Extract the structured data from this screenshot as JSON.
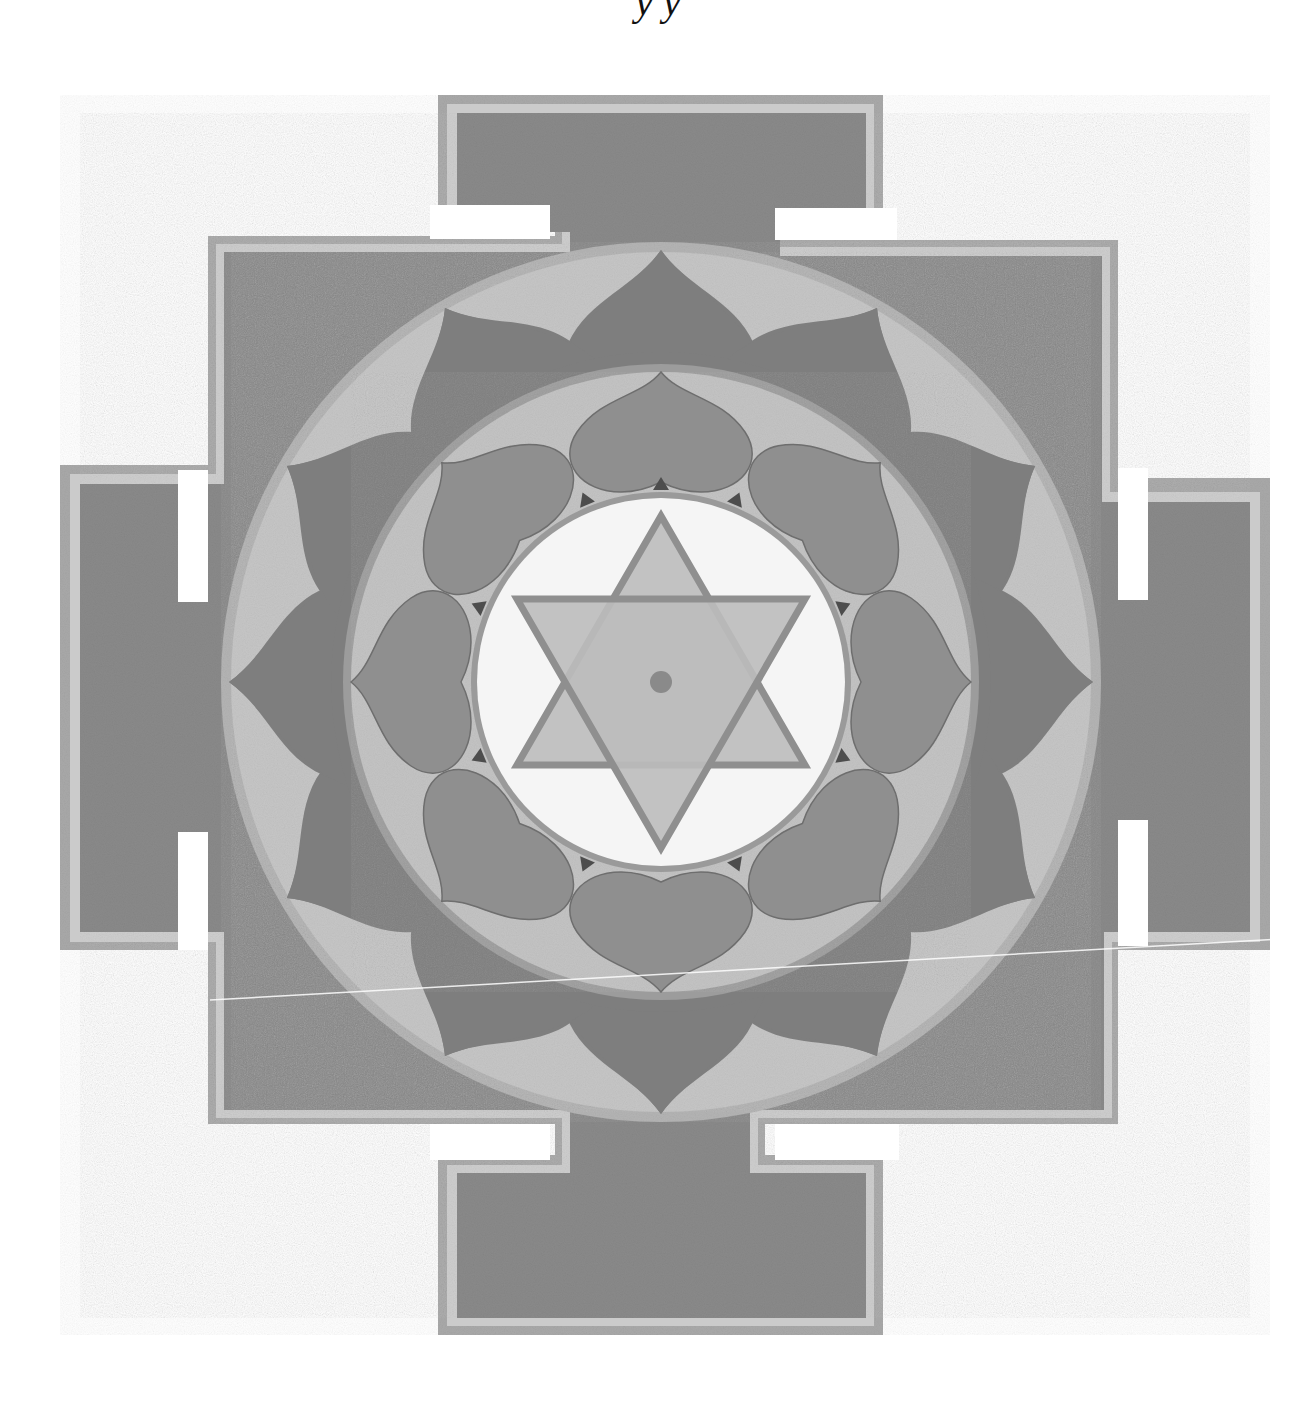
{
  "caption": {
    "text": "Sri Yantra · y y",
    "visible_fragment": "y y"
  },
  "image": {
    "subject": "yantra-mandala",
    "width": 1316,
    "height": 1406,
    "center": [
      661,
      682
    ],
    "colors": {
      "background": "#ffffff",
      "frame_fill": "#8a8a8a",
      "frame_outer_band": "#a9a9a9",
      "frame_inner_band": "#c9c9c9",
      "outer_ring_light": "#c4c4c4",
      "outer_petals": "#7d7d7d",
      "inner_ring_light": "#c2c2c2",
      "inner_petals": "#8e8e8e",
      "petal_shadow": "#4a4a4a",
      "inner_circle": "#f4f4f4",
      "star_fill": "#bdbdbd",
      "star_lines": "#8f8f8f",
      "bindu": "#8a8a8a"
    },
    "elements": {
      "outer_frame": "bhupura square with four T-shaped gates",
      "outer_petal_count": 12,
      "inner_petal_count": 8,
      "star": "six-pointed (two interlocking triangles)",
      "bindu": "central dot"
    }
  }
}
